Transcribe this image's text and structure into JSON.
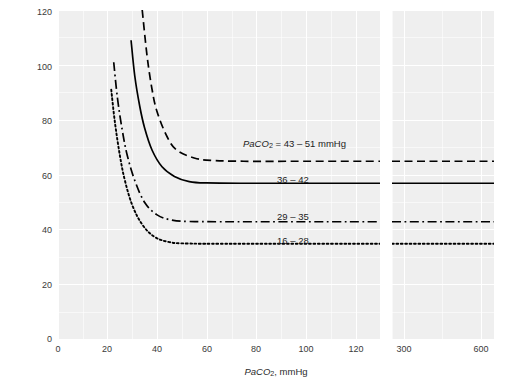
{
  "chart_data": {
    "type": "line",
    "title": "",
    "xlabel": "PaCO2, mmHg",
    "ylabel": "Cerebral Blood Flow, ml/min/100 g",
    "xlabel_parts": {
      "italic": "PaCO",
      "sub": "2",
      "rest": ", mmHg"
    },
    "ylim": [
      0,
      120
    ],
    "yticks": [
      0,
      20,
      40,
      60,
      80,
      100,
      120
    ],
    "xlim_left_panel": [
      0,
      130
    ],
    "xticks_left": [
      0,
      20,
      40,
      60,
      80,
      100,
      120
    ],
    "xlim_right_panel": [
      250,
      650
    ],
    "xticks_right": [
      300,
      600
    ],
    "axis_break": true,
    "grid": true,
    "legend_position": "inline-on-curves",
    "series": [
      {
        "name": "PaCO2 = 43 - 51 mmHg",
        "label": "PaCO2 = 43 – 51 mmHg",
        "label_parts": {
          "italic": "PaCO",
          "sub": "2",
          "rest": " = 43 – 51 mmHg"
        },
        "style": "dashed",
        "asymptote": 65,
        "start": {
          "x": 34,
          "y": 120
        },
        "points": [
          {
            "x": 34,
            "y": 120
          },
          {
            "x": 36,
            "y": 103
          },
          {
            "x": 38,
            "y": 91
          },
          {
            "x": 40,
            "y": 83
          },
          {
            "x": 44,
            "y": 74
          },
          {
            "x": 48,
            "y": 69
          },
          {
            "x": 55,
            "y": 66.2
          },
          {
            "x": 62,
            "y": 65.3
          },
          {
            "x": 75,
            "y": 65
          },
          {
            "x": 100,
            "y": 65
          },
          {
            "x": 130,
            "y": 65
          }
        ],
        "right_panel_value": 65
      },
      {
        "name": "36 - 42",
        "label": "36 – 42",
        "style": "solid",
        "asymptote": 57,
        "start": {
          "x": 29.5,
          "y": 109
        },
        "points": [
          {
            "x": 29.5,
            "y": 109
          },
          {
            "x": 31,
            "y": 96
          },
          {
            "x": 33,
            "y": 85
          },
          {
            "x": 35,
            "y": 77
          },
          {
            "x": 38,
            "y": 69
          },
          {
            "x": 42,
            "y": 63
          },
          {
            "x": 47,
            "y": 59.5
          },
          {
            "x": 53,
            "y": 57.6
          },
          {
            "x": 60,
            "y": 57.1
          },
          {
            "x": 80,
            "y": 57
          },
          {
            "x": 130,
            "y": 57
          }
        ],
        "right_panel_value": 57
      },
      {
        "name": "29 - 35",
        "label": "29 – 35",
        "style": "dashdot",
        "asymptote": 43,
        "start": {
          "x": 22.5,
          "y": 101
        },
        "points": [
          {
            "x": 22.5,
            "y": 101
          },
          {
            "x": 24,
            "y": 88
          },
          {
            "x": 26,
            "y": 76
          },
          {
            "x": 28,
            "y": 67
          },
          {
            "x": 31,
            "y": 58
          },
          {
            "x": 35,
            "y": 50
          },
          {
            "x": 40,
            "y": 45.5
          },
          {
            "x": 46,
            "y": 43.6
          },
          {
            "x": 53,
            "y": 43.1
          },
          {
            "x": 70,
            "y": 43
          },
          {
            "x": 130,
            "y": 43
          }
        ],
        "right_panel_value": 43
      },
      {
        "name": "16 - 28",
        "label": "16 – 28",
        "style": "dotted",
        "asymptote": 35,
        "start": {
          "x": 21.5,
          "y": 91
        },
        "points": [
          {
            "x": 21.5,
            "y": 91
          },
          {
            "x": 23,
            "y": 79
          },
          {
            "x": 25,
            "y": 67
          },
          {
            "x": 27,
            "y": 58
          },
          {
            "x": 30,
            "y": 49
          },
          {
            "x": 34,
            "y": 42
          },
          {
            "x": 39,
            "y": 37.5
          },
          {
            "x": 45,
            "y": 35.6
          },
          {
            "x": 52,
            "y": 35.1
          },
          {
            "x": 70,
            "y": 35
          },
          {
            "x": 130,
            "y": 35
          }
        ],
        "right_panel_value": 35
      }
    ],
    "annotations": [
      {
        "text": "PaCO2 = 43 – 51 mmHg",
        "x": 80,
        "y": 70
      },
      {
        "text": "36 – 42",
        "x": 82,
        "y": 61
      },
      {
        "text": "29 – 35",
        "x": 82,
        "y": 47
      },
      {
        "text": "16 – 28",
        "x": 82,
        "y": 38
      }
    ]
  },
  "axis": {
    "y_ticks": [
      "0",
      "20",
      "40",
      "60",
      "80",
      "100",
      "120"
    ],
    "x_ticks_left": [
      "0",
      "20",
      "40",
      "60",
      "80",
      "100",
      "120"
    ],
    "x_ticks_right": [
      "300",
      "600"
    ],
    "y_title": "Cerebral Blood Flow, ml/min/100 g"
  },
  "legend_labels": {
    "s1_italic": "PaCO",
    "s1_sub": "2",
    "s1_rest": " = 43 – 51 mmHg",
    "s2": "36 – 42",
    "s3": "29 – 35",
    "s4": "16 – 28"
  },
  "colors": {
    "panel_background": "#efefef",
    "gridline": "#ffffff",
    "line": "#000000",
    "text": "#2b2b2b"
  }
}
